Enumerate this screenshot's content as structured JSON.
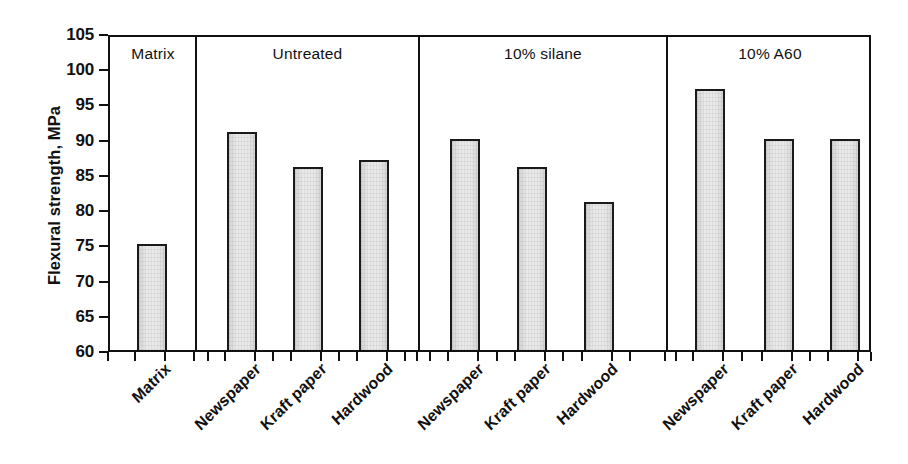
{
  "chart_data": {
    "type": "bar",
    "title": "",
    "subtitle": "",
    "xlabel": "",
    "ylabel": "Flexural strength, MPa",
    "ylim": [
      60,
      105
    ],
    "yticks": [
      60,
      65,
      70,
      75,
      80,
      85,
      90,
      95,
      100,
      105
    ],
    "grid": false,
    "legend_position": "none",
    "units": "MPa",
    "groups": [
      {
        "name": "Matrix",
        "categories": [
          "Matrix"
        ],
        "values": [
          75
        ]
      },
      {
        "name": "Untreated",
        "categories": [
          "Newspaper",
          "Kraft paper",
          "Hardwood"
        ],
        "values": [
          91,
          86,
          87
        ]
      },
      {
        "name": "10% silane",
        "categories": [
          "Newspaper",
          "Kraft paper",
          "Hardwood"
        ],
        "values": [
          90,
          86,
          81
        ]
      },
      {
        "name": "10% A60",
        "categories": [
          "Newspaper",
          "Kraft paper",
          "Hardwood"
        ],
        "values": [
          97,
          90,
          90
        ]
      }
    ],
    "categories": [
      "Matrix",
      "Newspaper",
      "Kraft paper",
      "Hardwood",
      "Newspaper",
      "Kraft paper",
      "Hardwood",
      "Newspaper",
      "Kraft paper",
      "Hardwood"
    ],
    "values": [
      75,
      91,
      86,
      87,
      90,
      86,
      81,
      97,
      90,
      90
    ],
    "bar_fill_color": "#e9e9e9",
    "bar_edge_color": "#1a1a1a",
    "axis_color": "#111111",
    "background_color": "#ffffff"
  },
  "axis": {
    "y_title": "Flexural strength, MPa",
    "ticks": [
      "105",
      "100",
      "95",
      "90",
      "85",
      "80",
      "75",
      "70",
      "65",
      "60"
    ]
  },
  "group_headers": [
    "Matrix",
    "Untreated",
    "10% silane",
    "10% A60"
  ],
  "x_categories": [
    "Matrix",
    "Newspaper",
    "Kraft paper",
    "Hardwood",
    "Newspaper",
    "Kraft paper",
    "Hardwood",
    "Newspaper",
    "Kraft paper",
    "Hardwood"
  ]
}
